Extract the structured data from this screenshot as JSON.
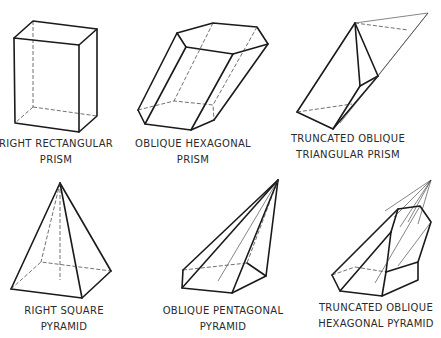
{
  "figure": {
    "shapes": [
      {
        "id": "right-rectangular-prism",
        "label_line1": "RIGHT  RECTANGULAR",
        "label_line2": "PRISM"
      },
      {
        "id": "oblique-hexagonal-prism",
        "label_line1": "OBLIQUE  HEXAGONAL",
        "label_line2": "PRISM"
      },
      {
        "id": "truncated-oblique-triangular-prism",
        "label_line1": "TRUNCATED OBLIQUE",
        "label_line2": "TRIANGULAR PRISM"
      },
      {
        "id": "right-square-pyramid",
        "label_line1": "RIGHT  SQUARE",
        "label_line2": "PYRAMID"
      },
      {
        "id": "oblique-pentagonal-pyramid",
        "label_line1": "OBLIQUE PENTAGONAL",
        "label_line2": "PYRAMID"
      },
      {
        "id": "truncated-oblique-hexagonal-pyramid",
        "label_line1": "TRUNCATED OBLIQUE",
        "label_line2": "HEXAGONAL PYRAMID"
      }
    ],
    "colors": {
      "line": "#1a1a1a",
      "background": "#ffffff",
      "text": "#2a2a2a"
    }
  }
}
